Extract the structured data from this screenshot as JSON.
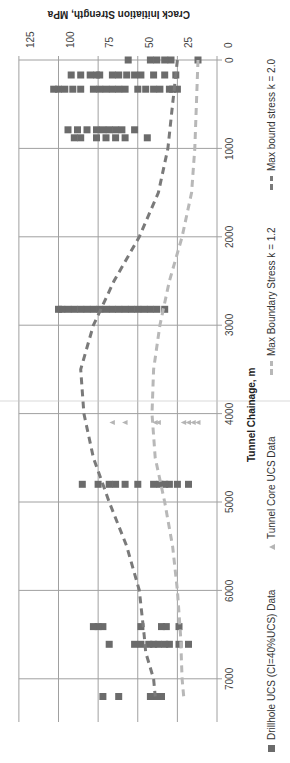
{
  "chart_data": {
    "type": "scatter",
    "orientation": "rotated 90° (page sideways): chainage runs top→bottom, strength axis runs right→left",
    "title": "",
    "xlabel": "Tunnel Chainage, m",
    "ylabel": "Crack Initiation Strength, MPa",
    "xlim": [
      0,
      7450
    ],
    "ylim": [
      0,
      125
    ],
    "x_ticks": [
      "0",
      "1000",
      "2000",
      "3000",
      "4000",
      "5000",
      "6000",
      "7000"
    ],
    "y_ticks": [
      "0",
      "25",
      "50",
      "75",
      "100",
      "125"
    ],
    "grid": true,
    "legend_position": "bottom",
    "series": [
      {
        "name": "Drillhole UCS (CI=40%UCS) Data",
        "marker": "square",
        "color": "#6b6b6b",
        "points": [
          [
            0,
            12
          ],
          [
            0,
            29
          ],
          [
            0,
            33
          ],
          [
            0,
            38
          ],
          [
            0,
            42
          ],
          [
            0,
            56
          ],
          [
            170,
            26
          ],
          [
            170,
            33
          ],
          [
            170,
            40
          ],
          [
            170,
            48
          ],
          [
            170,
            52
          ],
          [
            170,
            57
          ],
          [
            170,
            62
          ],
          [
            170,
            66
          ],
          [
            170,
            74
          ],
          [
            170,
            76
          ],
          [
            170,
            80
          ],
          [
            170,
            86
          ],
          [
            170,
            92
          ],
          [
            330,
            25
          ],
          [
            330,
            28
          ],
          [
            330,
            30
          ],
          [
            330,
            36
          ],
          [
            330,
            40
          ],
          [
            330,
            45
          ],
          [
            330,
            50
          ],
          [
            330,
            58
          ],
          [
            330,
            62
          ],
          [
            330,
            66
          ],
          [
            330,
            70
          ],
          [
            330,
            74
          ],
          [
            330,
            78
          ],
          [
            330,
            86
          ],
          [
            330,
            91
          ],
          [
            330,
            96
          ],
          [
            330,
            100
          ],
          [
            330,
            103
          ],
          [
            790,
            52
          ],
          [
            790,
            60
          ],
          [
            790,
            64
          ],
          [
            790,
            68
          ],
          [
            790,
            72
          ],
          [
            790,
            76
          ],
          [
            790,
            82
          ],
          [
            790,
            88
          ],
          [
            790,
            94
          ],
          [
            880,
            44
          ],
          [
            880,
            58
          ],
          [
            880,
            64
          ],
          [
            880,
            70
          ],
          [
            880,
            76
          ],
          [
            880,
            86
          ],
          [
            880,
            90
          ],
          [
            2820,
            33
          ],
          [
            2820,
            38
          ],
          [
            2820,
            42
          ],
          [
            2820,
            46
          ],
          [
            2820,
            50
          ],
          [
            2820,
            54
          ],
          [
            2820,
            58
          ],
          [
            2820,
            62
          ],
          [
            2820,
            66
          ],
          [
            2820,
            70
          ],
          [
            2820,
            74
          ],
          [
            2820,
            78
          ],
          [
            2820,
            82
          ],
          [
            2820,
            86
          ],
          [
            2820,
            90
          ],
          [
            2820,
            94
          ],
          [
            2820,
            98
          ],
          [
            2820,
            100
          ],
          [
            4800,
            18
          ],
          [
            4800,
            25
          ],
          [
            4800,
            30
          ],
          [
            4800,
            33
          ],
          [
            4800,
            36
          ],
          [
            4800,
            40
          ],
          [
            4800,
            50
          ],
          [
            4800,
            58
          ],
          [
            4800,
            64
          ],
          [
            4800,
            68
          ],
          [
            4800,
            75
          ],
          [
            4800,
            85
          ],
          [
            6410,
            24
          ],
          [
            6410,
            32
          ],
          [
            6410,
            35
          ],
          [
            6410,
            48
          ],
          [
            6410,
            72
          ],
          [
            6410,
            75
          ],
          [
            6410,
            78
          ],
          [
            6610,
            18
          ],
          [
            6610,
            24
          ],
          [
            6610,
            30
          ],
          [
            6610,
            33
          ],
          [
            6610,
            37
          ],
          [
            6610,
            40
          ],
          [
            6610,
            43
          ],
          [
            6610,
            48
          ],
          [
            6610,
            52
          ],
          [
            6610,
            68
          ],
          [
            7200,
            35
          ],
          [
            7200,
            38
          ],
          [
            7200,
            40
          ],
          [
            7200,
            42
          ],
          [
            7200,
            62
          ],
          [
            7200,
            72
          ]
        ]
      },
      {
        "name": "Tunnel Core UCS Data",
        "marker": "triangle",
        "color": "#b5b5b5",
        "points": [
          [
            4100,
            66
          ],
          [
            4100,
            58
          ],
          [
            4100,
            39
          ],
          [
            4100,
            37
          ],
          [
            4100,
            21
          ],
          [
            4100,
            18
          ],
          [
            4100,
            15
          ],
          [
            4100,
            12
          ]
        ]
      },
      {
        "name": "Max Boundary Stress k = 1.2",
        "line": "dashed",
        "color": "#b8b8b8",
        "points": [
          [
            0,
            12
          ],
          [
            500,
            13
          ],
          [
            1000,
            14
          ],
          [
            1500,
            16
          ],
          [
            2000,
            22
          ],
          [
            2500,
            30
          ],
          [
            3000,
            36
          ],
          [
            3500,
            40
          ],
          [
            4000,
            41
          ],
          [
            4500,
            39
          ],
          [
            5000,
            33
          ],
          [
            5500,
            28
          ],
          [
            6000,
            25
          ],
          [
            6500,
            23
          ],
          [
            7000,
            22
          ],
          [
            7200,
            21
          ]
        ]
      },
      {
        "name": "Max bound stress k = 2.0",
        "line": "dashed",
        "color": "#7a7a7a",
        "points": [
          [
            0,
            25
          ],
          [
            500,
            28
          ],
          [
            1000,
            31
          ],
          [
            1500,
            37
          ],
          [
            2000,
            49
          ],
          [
            2500,
            65
          ],
          [
            3000,
            78
          ],
          [
            3500,
            86
          ],
          [
            4000,
            84
          ],
          [
            4500,
            78
          ],
          [
            5000,
            68
          ],
          [
            5500,
            57
          ],
          [
            6000,
            49
          ],
          [
            6500,
            46
          ],
          [
            6700,
            45
          ],
          [
            7000,
            40
          ],
          [
            7200,
            39
          ]
        ]
      }
    ]
  },
  "axes": {
    "y_title": "Crack Initiation Strength, MPa",
    "x_title": "Tunnel Chainage, m",
    "y_ticks": [
      "0",
      "25",
      "50",
      "75",
      "100",
      "125"
    ],
    "x_ticks": [
      "0",
      "1000",
      "2000",
      "3000",
      "4000",
      "5000",
      "6000",
      "7000"
    ]
  },
  "legend": {
    "items": [
      {
        "label": "Drillhole UCS (CI=40%UCS) Data",
        "marker": "square",
        "color": "#6b6b6b"
      },
      {
        "label": "Tunnel Core UCS Data",
        "marker": "triangle",
        "color": "#b5b5b5"
      },
      {
        "label": "Max Boundary Stress k = 1.2",
        "marker": "dash",
        "color": "#b8b8b8"
      },
      {
        "label": "Max bound stress k = 2.0",
        "marker": "dash",
        "color": "#7a7a7a"
      }
    ]
  },
  "colors": {
    "grid": "#a0a0a0",
    "axis": "#8a8a8a",
    "text": "#333333"
  }
}
